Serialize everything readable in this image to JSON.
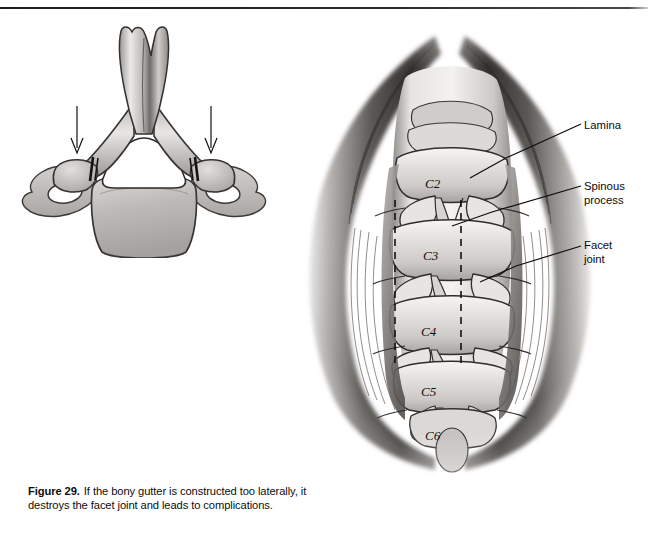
{
  "page": {
    "background_color": "#ffffff",
    "header_rule_color": "#222222"
  },
  "caption": {
    "figure_number": "Figure 29.",
    "text": "If the bony gutter is constructed too laterally, it destroys the facet joint and leads to complications."
  },
  "labels": [
    {
      "id": "lamina",
      "text": "Lamina"
    },
    {
      "id": "spinous",
      "text": "Spinous\nprocess"
    },
    {
      "id": "facet",
      "text": "Facet\njoint"
    }
  ],
  "figure_left": {
    "name": "axial-cervical-vertebra",
    "description": "Axial view of a cervical vertebra with two arrows indicating gutter sites",
    "arrows": [
      {
        "id": "left-gutter-arrow",
        "label": ""
      },
      {
        "id": "right-gutter-arrow",
        "label": ""
      }
    ]
  },
  "figure_right": {
    "name": "posterior-cervical-exposure",
    "description": "Posterior surgical exposure of cervical spine with retracted paraspinal muscles",
    "vertebra_labels": [
      "C2",
      "C3",
      "C4",
      "C5",
      "C6"
    ],
    "gutter_lines": [
      "left-dashed-gutter",
      "right-dashed-gutter"
    ]
  },
  "colors": {
    "ink": "#0d0d0d",
    "bone_light": "#f2f0ee",
    "bone_mid": "#c9c6c3",
    "bone_shadow": "#8e8b88",
    "muscle_dark": "#4a4745",
    "muscle_deep": "#262423"
  }
}
